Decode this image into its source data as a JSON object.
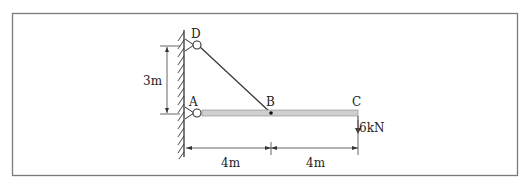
{
  "diagram": {
    "type": "structural-beam",
    "nodes": {
      "A": "A",
      "B": "B",
      "C": "C",
      "D": "D"
    },
    "load": "6kN",
    "dimensions": {
      "vertical": "3m",
      "span_ab": "4m",
      "span_bc": "4m"
    },
    "colors": {
      "frame": "#7a7a7a",
      "beam_fill": "#cfcfcf",
      "line": "#333333"
    }
  }
}
